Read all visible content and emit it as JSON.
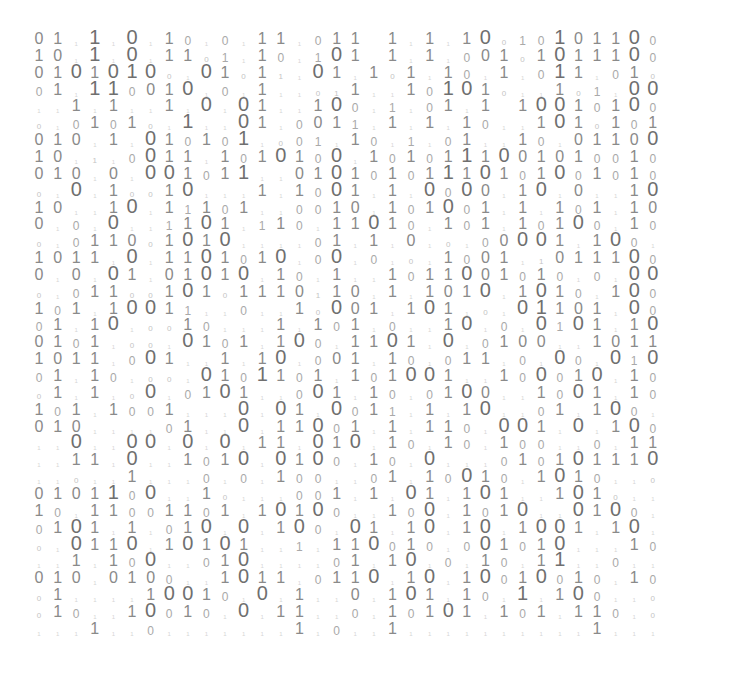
{
  "image": {
    "description": "Grid of binary digits (0 and 1) in varying sizes and gray shades on a white background",
    "background": "#ffffff",
    "digit_colors": {
      "xl": "#6f6f6f",
      "l": "#8a8a8a",
      "m": "#a9a9a9",
      "s": "#c4c4c4",
      "xs": "#d6d6d6"
    },
    "grid": {
      "columns": 36,
      "rows": 36,
      "legend": {
        "0": "large zero",
        "1": "large one",
        "Z": "extra-large zero",
        "O": "extra-large one",
        "a": "medium zero",
        "b": "medium one",
        "c": "small zero",
        "d": "small one",
        ".": "tiny faint mark",
        " ": "blank"
      },
      "row_data": [
        "01.O.Z.1a.a.11.a11 1.1.1ZcbaO011Za",
        "10.O.Z.11cb.1a.bZ1 1.1.a01c1Z111Za",
        "01Z1ZOZc.Z1c1d.Z1.1c1.1a.1.aO1.a1c",
        "a1.OOa01Z.a.1..cd1..1aOZ1c..1cb.ZZ",
        "..1.1..1.Z.Z1..1Za.b.a1.1 1ZZ1a1Za",
        "c.a1a1c.O..Z1.a01b.1.1.1a..1Z1c1a1",
        "010.1.Z1a1aO.cab.1a.b.a1..1a.0110Z",
        "10.d.aZ11.1a1Z1aZ.1a1a1O1Z0101aa1a",
        "010.0.ZZ1a1O..01Z1a1a1O1Z1a1Za1a1a",
        "c.Z.1cc1Z...1.1aZ1.1.ZaZ0.1Z.0..1Z",
        "10..1Z.1b1a1..aa10.1a1Za1.1.1a1.10",
        "0.a.Z..b1Z1.b1a.11Z1a.1a1.1a1Za.1a",
        "c.a110c1Z1Z....a1.1.0.c.a0ZZ1.1Za.",
        "1011.Z.11Z1a1Z.aZ.a.c.1a01.d0111Za",
        "0.0.Z1.01Z1Z.1a.1..1a11Z01a1a.a.ZZ",
        "c.a11cc1Z1c1110d10.1.101Z.1Z1a.1Za",
        "1a1.1ZZ1b..a..1cZ01.1Z1.c.ZO101.Za",
        "a1.1Z.cc1a...1.1a1.a..1Z.a.ZbZ1.1Z",
        "01a1.cc.Z1a1.1Za.11Z1.Z.a100..1011",
        "1011.aZ1..1.1Z.a01.1a.a11.a.Za.ZbZ",
        "a1.1a.cc.Z1aO1a1.1a1ZZ1..1aZa1Z.1a",
        "c1.1.cZ.a1Z1..aZ1.1a.a1Z0..1aZ1.1a",
        "1a1.1aa1...Z.Z1.Za1b.1.1Z..a1.1Za.",
        "010....a1..Z.11Za1.1.11a.ZZ1.Z.1Za",
        "..Z..ZZ.Z.Z.11.Z1Z.1a.1a.1aa..a.11",
        "..11.Z..1a1Z.Z1Za.1a.Z...a1a1Z111Z",
        "..c..1...a.a.1aa..a1.1aZ1a.1Z1a..c",
        "0101OaZ..1c...aa1.1.Z1.1Z1..1Z1c..",
        "1a.11aa11a1.1Z1Za..1aZ.1a1Z..Z1Za.",
        "a1Z1.1.a1Z.Z.1Za.Z1.1Z.1Z.1ZZ1.1Z.",
        "c.Z11Z.1Z1Z1..b.11Za1a.aZ1a1Z...1a",
        "..1.1aZ..a1Z....a1.1Z.a.1a.1O..a..",
        "010.010a..1Z11.a11Z.1Z.1Za1Za1a.1a",
        "c1....1ZZ1a.Z.1..0.1Z1.1a.O.1Za..c",
        "c1a..1Za1a.Z.11..a.1a1Z1.1a1.11a.c",
        "...1..a.......1.a..1..........1..."
      ]
    }
  }
}
